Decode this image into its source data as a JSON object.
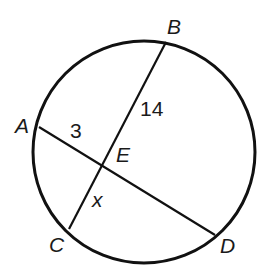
{
  "diagram": {
    "type": "circle-intersecting-chords",
    "circle": {
      "cx": 144,
      "cy": 152,
      "r": 111,
      "stroke": "#111111"
    },
    "points": {
      "A": {
        "x": 39,
        "y": 127,
        "label": "A",
        "label_x": 15,
        "label_y": 133
      },
      "B": {
        "x": 166,
        "y": 42,
        "label": "B",
        "label_x": 167,
        "label_y": 34
      },
      "C": {
        "x": 69,
        "y": 229,
        "label": "C",
        "label_x": 49,
        "label_y": 252
      },
      "D": {
        "x": 215,
        "y": 235,
        "label": "D",
        "label_x": 220,
        "label_y": 253
      },
      "E": {
        "x": 101,
        "y": 163,
        "label": "E",
        "label_x": 116,
        "label_y": 162
      }
    },
    "chords": [
      {
        "from": "A",
        "to": "D"
      },
      {
        "from": "B",
        "to": "C"
      }
    ],
    "segment_labels": [
      {
        "text": "3",
        "x": 70,
        "y": 138,
        "italic": false
      },
      {
        "text": "14",
        "x": 140,
        "y": 116,
        "italic": false
      },
      {
        "text": "x",
        "x": 92,
        "y": 207,
        "italic": true
      }
    ]
  }
}
